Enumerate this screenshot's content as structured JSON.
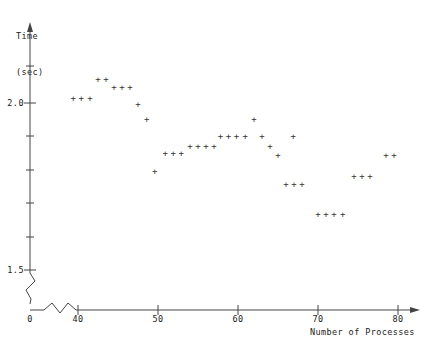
{
  "chart_data": {
    "type": "scatter",
    "title": "",
    "xlabel": "Number of Processes",
    "ylabel": "Time (sec)",
    "ylabel_line1": "Time",
    "ylabel_line2": "(sec)",
    "marker": "+",
    "marker_color": "#333333",
    "axis_color": "#444444",
    "grid": false,
    "legend": null,
    "xlim": [
      38,
      82
    ],
    "ylim": [
      1.46,
      2.12
    ],
    "x_axis_break": true,
    "y_axis_break": true,
    "x_origin_label": "0",
    "xticks": [
      40,
      50,
      60,
      70,
      80
    ],
    "xticklabels": [
      "40",
      "50",
      "60",
      "70",
      "80"
    ],
    "yticks": [
      1.5,
      1.6,
      1.7,
      1.8,
      1.9,
      2.0
    ],
    "yticklabels": [
      "1.5",
      "",
      "",
      "",
      "",
      "2.0"
    ],
    "ylabeled_ticks": [
      {
        "value": 2.0,
        "label": "2.0"
      },
      {
        "value": 1.5,
        "label": "1.5"
      }
    ],
    "points": [
      {
        "x": 39.4,
        "y": 2.013
      },
      {
        "x": 40.4,
        "y": 2.013
      },
      {
        "x": 41.5,
        "y": 2.013
      },
      {
        "x": 42.5,
        "y": 2.07
      },
      {
        "x": 43.5,
        "y": 2.07
      },
      {
        "x": 44.5,
        "y": 2.046
      },
      {
        "x": 45.5,
        "y": 2.046
      },
      {
        "x": 46.5,
        "y": 2.046
      },
      {
        "x": 47.5,
        "y": 1.995
      },
      {
        "x": 48.6,
        "y": 1.95
      },
      {
        "x": 49.6,
        "y": 1.795
      },
      {
        "x": 50.9,
        "y": 1.85
      },
      {
        "x": 51.9,
        "y": 1.85
      },
      {
        "x": 52.9,
        "y": 1.85
      },
      {
        "x": 54.0,
        "y": 1.871
      },
      {
        "x": 55.0,
        "y": 1.871
      },
      {
        "x": 56.0,
        "y": 1.871
      },
      {
        "x": 57.0,
        "y": 1.871
      },
      {
        "x": 57.8,
        "y": 1.9
      },
      {
        "x": 58.8,
        "y": 1.9
      },
      {
        "x": 59.8,
        "y": 1.9
      },
      {
        "x": 60.9,
        "y": 1.9
      },
      {
        "x": 62.0,
        "y": 1.95
      },
      {
        "x": 63.0,
        "y": 1.9
      },
      {
        "x": 64.0,
        "y": 1.87
      },
      {
        "x": 65.0,
        "y": 1.843
      },
      {
        "x": 66.9,
        "y": 1.9
      },
      {
        "x": 66.0,
        "y": 1.755
      },
      {
        "x": 67.0,
        "y": 1.755
      },
      {
        "x": 68.0,
        "y": 1.755
      },
      {
        "x": 70.0,
        "y": 1.665
      },
      {
        "x": 71.0,
        "y": 1.665
      },
      {
        "x": 72.0,
        "y": 1.665
      },
      {
        "x": 73.1,
        "y": 1.665
      },
      {
        "x": 74.5,
        "y": 1.78
      },
      {
        "x": 75.5,
        "y": 1.78
      },
      {
        "x": 76.5,
        "y": 1.78
      },
      {
        "x": 78.5,
        "y": 1.843
      },
      {
        "x": 79.5,
        "y": 1.843
      }
    ]
  },
  "plot_geometry": {
    "x_pixel_at_40": 78,
    "x_pixel_per_unit": 8.0,
    "y_pixel_at_2_0": 103,
    "y_pixel_per_0_1": 33.4,
    "axis_origin_x": 30,
    "axis_y_baseline": 310
  }
}
